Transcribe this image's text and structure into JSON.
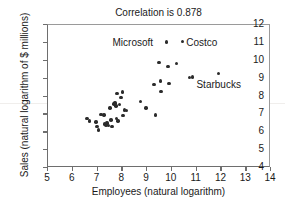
{
  "chart_data": {
    "type": "scatter",
    "title": "Correlation is 0.878",
    "xlabel": "Employees (natural logarithm)",
    "ylabel": "Sales (natural logarithm of $ millions)",
    "xlim": [
      5,
      14
    ],
    "ylim": [
      4,
      12
    ],
    "xticks": [
      5,
      6,
      7,
      8,
      9,
      10,
      11,
      12,
      13,
      14
    ],
    "yticks": [
      4,
      5,
      6,
      7,
      8,
      9,
      10,
      11,
      12
    ],
    "grid": false,
    "legend": "none",
    "marker_color": "#2b2b2b",
    "axis_color": "#6e6e6e",
    "correlation": 0.878,
    "points": [
      {
        "x": 6.62,
        "y": 6.7
      },
      {
        "x": 6.72,
        "y": 6.58
      },
      {
        "x": 6.97,
        "y": 6.52
      },
      {
        "x": 7.02,
        "y": 6.28
      },
      {
        "x": 7.08,
        "y": 6.08
      },
      {
        "x": 7.18,
        "y": 6.95
      },
      {
        "x": 7.3,
        "y": 6.9
      },
      {
        "x": 7.32,
        "y": 6.4
      },
      {
        "x": 7.38,
        "y": 6.34
      },
      {
        "x": 7.42,
        "y": 6.46
      },
      {
        "x": 7.48,
        "y": 6.33
      },
      {
        "x": 7.55,
        "y": 7.3
      },
      {
        "x": 7.58,
        "y": 6.62
      },
      {
        "x": 7.62,
        "y": 6.28
      },
      {
        "x": 7.7,
        "y": 7.52
      },
      {
        "x": 7.74,
        "y": 7.58
      },
      {
        "x": 7.78,
        "y": 7.42
      },
      {
        "x": 7.8,
        "y": 6.7
      },
      {
        "x": 7.82,
        "y": 8.1
      },
      {
        "x": 7.86,
        "y": 6.58
      },
      {
        "x": 7.92,
        "y": 7.48
      },
      {
        "x": 7.98,
        "y": 7.9
      },
      {
        "x": 8.04,
        "y": 8.2
      },
      {
        "x": 8.06,
        "y": 6.88
      },
      {
        "x": 8.12,
        "y": 7.18
      },
      {
        "x": 8.2,
        "y": 7.16
      },
      {
        "x": 8.78,
        "y": 7.66
      },
      {
        "x": 9.0,
        "y": 7.3
      },
      {
        "x": 9.32,
        "y": 8.6
      },
      {
        "x": 9.38,
        "y": 6.92
      },
      {
        "x": 9.52,
        "y": 9.85
      },
      {
        "x": 9.58,
        "y": 8.82
      },
      {
        "x": 9.6,
        "y": 8.22
      },
      {
        "x": 9.88,
        "y": 9.62
      },
      {
        "x": 9.92,
        "y": 8.66
      },
      {
        "x": 10.22,
        "y": 9.8
      },
      {
        "x": 10.76,
        "y": 9.02
      },
      {
        "x": 10.86,
        "y": 9.04
      },
      {
        "x": 11.92,
        "y": 9.22
      },
      {
        "x": 10.46,
        "y": 11.02
      },
      {
        "x": 9.82,
        "y": 11.0
      }
    ],
    "annotations": [
      {
        "label": "Microsoft",
        "text_x": 9.3,
        "text_y": 11.02,
        "anchor": "right"
      },
      {
        "label": "Costco",
        "text_x": 10.62,
        "text_y": 11.02,
        "anchor": "left"
      },
      {
        "label": "Starbucks",
        "text_x": 11.92,
        "text_y": 8.62,
        "anchor": "center"
      }
    ]
  }
}
